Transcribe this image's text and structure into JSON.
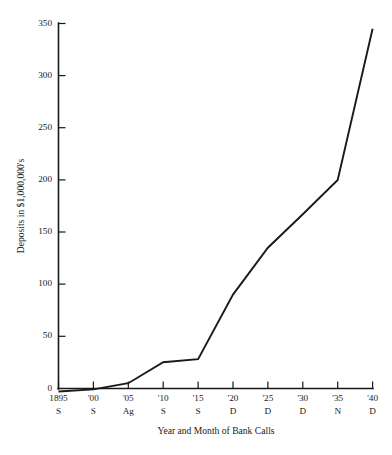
{
  "chart_data": {
    "type": "line",
    "title": "",
    "subtitle": "",
    "xlabel": "Year and Month of Bank Calls",
    "ylabel": "Deposits in $1,000,000's",
    "ylim": [
      0,
      350
    ],
    "yticks": [
      0,
      50,
      100,
      150,
      200,
      250,
      300,
      350
    ],
    "ytick_labels": [
      "0",
      "50",
      "100",
      "150",
      "200",
      "250",
      "300",
      "350"
    ],
    "grid": false,
    "legend": null,
    "categories": [
      "1895",
      "'00",
      "'05",
      "'10",
      "'15",
      "'20",
      "'25",
      "'30",
      "'35",
      "'40"
    ],
    "category_months": [
      "S",
      "S",
      "Ag",
      "S",
      "S",
      "D",
      "D",
      "D",
      "N",
      "D"
    ],
    "xtick_labels_line1": [
      "1895",
      "'00",
      "'05",
      "'10",
      "'15",
      "'20",
      "'25",
      "'30",
      "'35",
      "'40"
    ],
    "xtick_labels_line2": [
      "S",
      "S",
      "Ag",
      "S",
      "S",
      "D",
      "D",
      "D",
      "N",
      "D"
    ],
    "values": [
      -3,
      -1,
      5,
      25,
      28,
      90,
      135,
      167,
      200,
      345
    ],
    "series": [
      {
        "name": "Deposits",
        "values": [
          -3,
          -1,
          5,
          25,
          28,
          90,
          135,
          167,
          200,
          345
        ]
      }
    ],
    "line_color": "#1a1a1a",
    "axis_color": "#181818",
    "background_color": "#ffffff"
  },
  "axes": {
    "y_title": "Deposits in $1,000,000's",
    "x_title": "Year and Month of Bank Calls"
  }
}
